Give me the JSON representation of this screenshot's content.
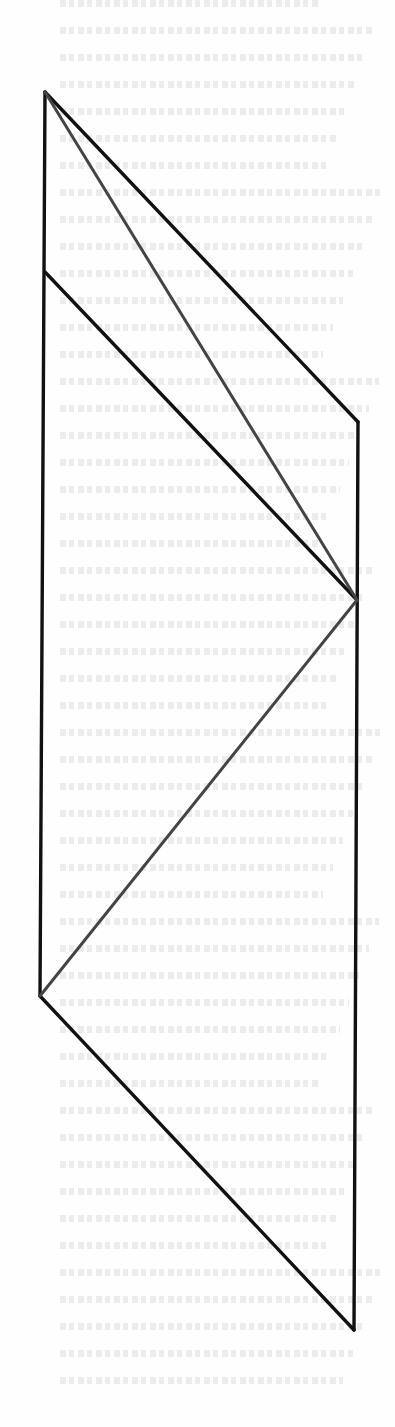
{
  "page": {
    "background": "#fefefe",
    "bleed_through_text": "illegible"
  },
  "diagram": {
    "outline_color": "#111111",
    "diagonal_color": "#444444",
    "points": {
      "A": [
        45,
        92
      ],
      "B": [
        358,
        422
      ],
      "C": [
        357,
        600
      ],
      "D": [
        45,
        272
      ],
      "E": [
        40,
        996
      ],
      "F": [
        354,
        1330
      ]
    },
    "segments": [
      {
        "from": "A",
        "to": "B",
        "style": "outline"
      },
      {
        "from": "B",
        "to": "F",
        "style": "outline"
      },
      {
        "from": "F",
        "to": "E",
        "style": "outline"
      },
      {
        "from": "E",
        "to": "A",
        "style": "outline"
      },
      {
        "from": "D",
        "to": "C",
        "style": "outline"
      },
      {
        "from": "A",
        "to": "C",
        "style": "diagonal"
      },
      {
        "from": "E",
        "to": "C",
        "style": "diagonal"
      }
    ]
  }
}
